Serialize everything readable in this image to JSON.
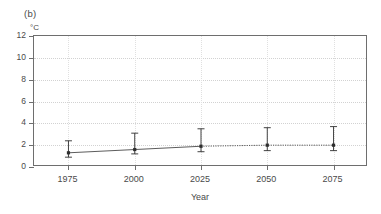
{
  "panel": {
    "label": "(b)"
  },
  "axes": {
    "y_unit": "°C",
    "y_ticks": [
      "0",
      "2",
      "4",
      "6",
      "8",
      "10",
      "12"
    ],
    "x_ticks": [
      "1975",
      "2000",
      "2025",
      "2050",
      "2075"
    ],
    "x_title": "Year"
  },
  "chart_data": {
    "type": "line",
    "title": "(b)",
    "xlabel": "Year",
    "ylabel": "°C",
    "xlim": [
      1962,
      2088
    ],
    "ylim": [
      0,
      12
    ],
    "grid": true,
    "legend": "none",
    "x": [
      1975,
      2000,
      2025,
      2050,
      2075
    ],
    "categories": [
      "1975",
      "2000",
      "2025",
      "2050",
      "2075"
    ],
    "values": [
      1.3,
      1.6,
      1.9,
      2.0,
      2.0
    ],
    "error_low": [
      0.9,
      1.2,
      1.4,
      1.5,
      1.5
    ],
    "error_high": [
      2.4,
      3.1,
      3.5,
      3.6,
      3.7
    ],
    "series": [
      {
        "name": "temperature",
        "marker": "square",
        "line_style": "solid-to-dotted",
        "values": [
          1.3,
          1.6,
          1.9,
          2.0,
          2.0
        ]
      }
    ],
    "y_ticks": [
      0,
      2,
      4,
      6,
      8,
      10,
      12
    ],
    "x_ticks": [
      1975,
      2000,
      2025,
      2050,
      2075
    ],
    "colors": {
      "line": "#4a4a4a",
      "marker": "#2e2e2e",
      "grid": "#d2d2d2",
      "axis": "#6e6e6e"
    }
  }
}
